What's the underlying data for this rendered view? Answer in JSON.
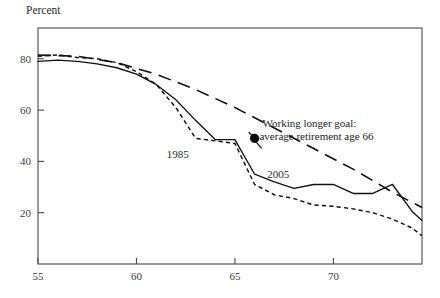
{
  "chart_data": {
    "type": "line",
    "title": "",
    "xlabel": "",
    "ylabel": "Percent",
    "xlim": [
      55,
      74.5
    ],
    "ylim": [
      0,
      92
    ],
    "grid": false,
    "legend_position": "inline-labels",
    "xticks": [
      55,
      60,
      65,
      70
    ],
    "xtick_labels": [
      "55",
      "60",
      "65",
      "70"
    ],
    "yticks": [
      20,
      40,
      60,
      80
    ],
    "ytick_labels": [
      "20",
      "40",
      "60",
      "80"
    ],
    "series": [
      {
        "name": "1985",
        "style": "short-dash",
        "label": "1985",
        "label_x": 62.1,
        "label_y": 41.5,
        "x": [
          55,
          56,
          57,
          58,
          59,
          60,
          61,
          62,
          63,
          64,
          65,
          66,
          67,
          68,
          69,
          70,
          71,
          72,
          73,
          74,
          74.5
        ],
        "values": [
          81,
          81.5,
          80.5,
          80,
          78.5,
          75,
          70,
          61,
          49,
          48,
          47,
          31,
          27,
          25.5,
          23,
          22.5,
          21.5,
          20,
          17.5,
          14,
          11
        ]
      },
      {
        "name": "2005",
        "style": "solid",
        "label": "2005",
        "label_x": 67.2,
        "label_y": 33.5,
        "x": [
          55,
          56,
          57,
          58,
          59,
          60,
          61,
          62,
          63,
          64,
          65,
          66,
          67,
          68,
          69,
          70,
          71,
          72,
          73,
          74,
          74.5
        ],
        "values": [
          79,
          79.5,
          79,
          78,
          76.5,
          74,
          70,
          64,
          56,
          48.5,
          48.5,
          35,
          32,
          29.5,
          31,
          31,
          27.5,
          27.5,
          31,
          20.5,
          17
        ]
      },
      {
        "name": "Working longer goal",
        "style": "long-dash",
        "label": "",
        "x": [
          55,
          57,
          59,
          61,
          63,
          65,
          67,
          69,
          71,
          73,
          74.5
        ],
        "values": [
          81.5,
          81,
          78.5,
          74,
          68,
          61,
          53,
          45,
          37,
          28,
          22
        ]
      }
    ],
    "annotations": [
      {
        "name": "working-longer-goal",
        "line1": "Working longer goal:",
        "line2": "average retirement age 66",
        "text_x": 66.4,
        "text_y1": 53.5,
        "text_y2": 48.5,
        "dot_x": 66.0,
        "dot_y": 49.0,
        "dot_radius": 4.2
      }
    ],
    "colors": {
      "axis": "#4a4a4a",
      "series": "#111111",
      "text": "#1c1c1c",
      "background": "#ffffff"
    }
  }
}
